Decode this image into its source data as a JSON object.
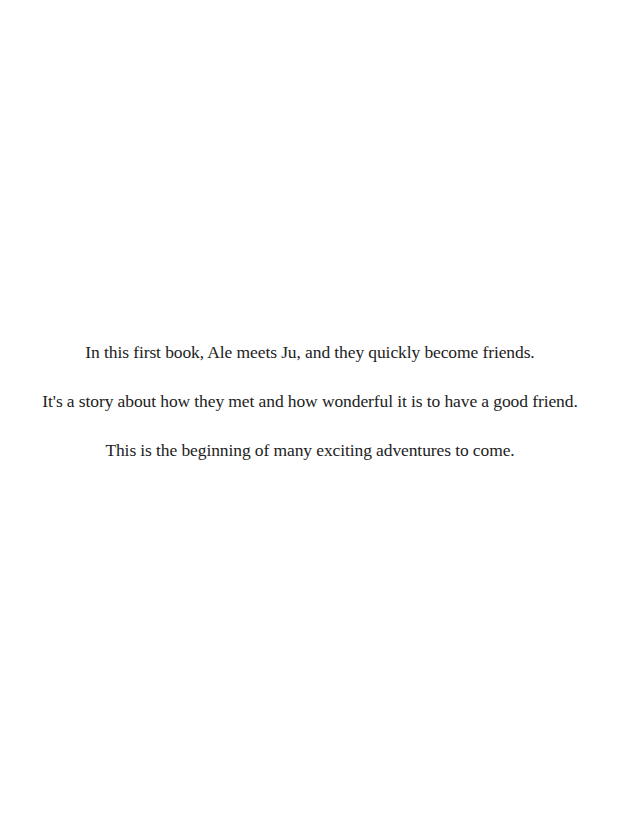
{
  "page": {
    "background_color": "#ffffff",
    "text_color": "#222222",
    "paragraphs": [
      "In this first book, Ale meets Ju, and they quickly become friends.",
      "It's a story about how they met and how wonderful it is to have a good friend.",
      "This is the beginning of many exciting adventures to come."
    ]
  }
}
